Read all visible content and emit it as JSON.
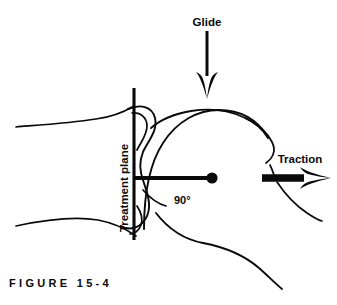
{
  "figure": {
    "caption": "F I G U R E   1 5 - 4",
    "caption_plain": "FIGURE 15-4",
    "background_color": "#ffffff",
    "ink_color": "#0a0a0a",
    "width": 337,
    "height": 305
  },
  "labels": {
    "glide": "Glide",
    "traction": "Traction",
    "treatment_plane": "Treatment plane",
    "angle": "90°"
  },
  "diagram": {
    "type": "line-art anatomical illustration",
    "treatment_plane_line": {
      "x": 134,
      "y_top": 88,
      "y_bottom": 240
    },
    "perpendicular_axis": {
      "x_start": 134,
      "x_end": 212,
      "y": 178
    },
    "axis_endpoint_dot": {
      "cx": 212,
      "cy": 178,
      "r": 5.6
    },
    "glide_arrow": {
      "direction": "down",
      "x": 207,
      "y_start": 31,
      "y_tip": 99
    },
    "traction_arrow": {
      "direction": "right",
      "y": 178,
      "x_start": 262,
      "x_tip": 331
    }
  }
}
